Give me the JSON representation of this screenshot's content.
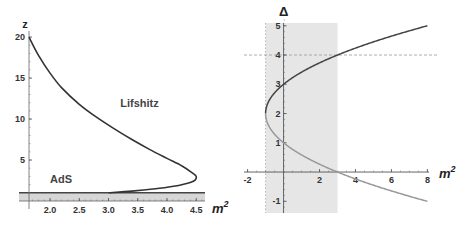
{
  "chart_data": [
    {
      "type": "line",
      "title": "",
      "xlabel": "m^2",
      "ylabel": "z",
      "xlim": [
        1.64,
        4.65
      ],
      "ylim": [
        0,
        20.5
      ],
      "xticks": [
        "2.0",
        "2.5",
        "3.0",
        "3.5",
        "4.0",
        "4.5"
      ],
      "xtick_values": [
        2.0,
        2.5,
        3.0,
        3.5,
        4.0,
        4.5
      ],
      "yticks": [
        "5",
        "10",
        "15",
        "20"
      ],
      "ytick_values": [
        5,
        10,
        15,
        20
      ],
      "annotations": [
        {
          "text": "Lifshitz",
          "x": 3.2,
          "y": 11.5
        },
        {
          "text": "AdS",
          "x": 2.0,
          "y": 2.2
        }
      ],
      "shaded_band": {
        "y_from": 0,
        "y_to": 1,
        "label": "AdS"
      },
      "series": [
        {
          "name": "Lifshitz curve",
          "points": [
            [
              1.64,
              20
            ],
            [
              1.8,
              17.8
            ],
            [
              2.0,
              15.6
            ],
            [
              2.2,
              13.8
            ],
            [
              2.5,
              11.8
            ],
            [
              2.8,
              10.2
            ],
            [
              3.1,
              8.8
            ],
            [
              3.4,
              7.5
            ],
            [
              3.7,
              6.3
            ],
            [
              4.0,
              5.2
            ],
            [
              4.25,
              4.3
            ],
            [
              4.42,
              3.5
            ],
            [
              4.5,
              3.0
            ],
            [
              4.45,
              2.4
            ],
            [
              4.2,
              1.9
            ],
            [
              3.8,
              1.5
            ],
            [
              3.4,
              1.2
            ],
            [
              3.0,
              1.0
            ]
          ]
        }
      ]
    },
    {
      "type": "line",
      "title": "",
      "xlabel": "m^2",
      "ylabel": "Δ",
      "xlim": [
        -2.2,
        8.2
      ],
      "ylim": [
        -1.4,
        5.3
      ],
      "xticks": [
        "-2",
        "2",
        "4",
        "6",
        "8"
      ],
      "xtick_values": [
        -2,
        2,
        4,
        6,
        8
      ],
      "yticks": [
        "-1",
        "1",
        "2",
        "3",
        "4",
        "5"
      ],
      "ytick_values": [
        -1,
        1,
        2,
        3,
        4,
        5
      ],
      "shaded_band": {
        "x_from": -1,
        "x_to": 3
      },
      "reference_line": {
        "y": 4,
        "style": "dashed"
      },
      "series": [
        {
          "name": "Delta plus",
          "formula": "2 + sqrt(4 + m^2)",
          "x_range": [
            -1,
            8
          ],
          "color": "#555555"
        },
        {
          "name": "Delta minus",
          "formula": "2 - sqrt(4 + m^2)",
          "x_range": [
            -1,
            8
          ],
          "color": "#999999"
        }
      ]
    }
  ],
  "colors": {
    "curve_dark": "#3a3a3a",
    "curve_light": "#9a9a9a",
    "band": "#d8d8d8",
    "axis": "#555555"
  }
}
